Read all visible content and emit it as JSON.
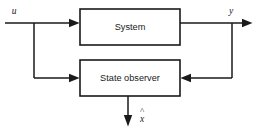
{
  "diagram": {
    "type": "block-diagram",
    "background_color": "#ffffff",
    "line_color": "#1a1a1a",
    "blocks": [
      {
        "id": "system",
        "label": "System",
        "x": 80,
        "y": 9,
        "width": 100,
        "height": 36
      },
      {
        "id": "state_observer",
        "label": "State observer",
        "x": 80,
        "y": 60,
        "width": 100,
        "height": 36
      }
    ],
    "signals": [
      {
        "id": "input_u",
        "label": "u",
        "italic": true,
        "x": 14,
        "y": 12
      },
      {
        "id": "output_y",
        "label": "y",
        "italic": true,
        "x": 231,
        "y": 12
      },
      {
        "id": "estimate_xhat",
        "label": "x",
        "accent": "^",
        "italic": true,
        "x": 142,
        "y": 118
      }
    ],
    "connections": [
      {
        "id": "u-to-system",
        "from": "input u",
        "to": "System",
        "direction": "right"
      },
      {
        "id": "u-branch-to-observer",
        "from": "input u branch",
        "to": "State observer",
        "direction": "right"
      },
      {
        "id": "system-to-y",
        "from": "System",
        "to": "output y",
        "direction": "right"
      },
      {
        "id": "y-branch-to-observer",
        "from": "output y branch",
        "to": "State observer",
        "direction": "left"
      },
      {
        "id": "observer-to-xhat",
        "from": "State observer",
        "to": "estimate x-hat",
        "direction": "down"
      }
    ]
  }
}
